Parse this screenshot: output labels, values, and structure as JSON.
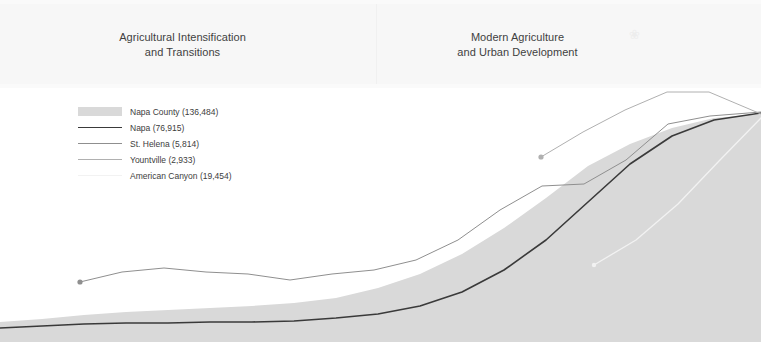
{
  "eras": {
    "dividers_x": [
      376
    ],
    "items": [
      {
        "label": "Agricultural Intensification\nand Transitions"
      },
      {
        "label": "Modern Agriculture\nand Urban Development"
      }
    ],
    "decorative_mark": "❀"
  },
  "legend": {
    "items": [
      {
        "name": "Napa County",
        "value": "136,484",
        "label": "Napa County (136,484)",
        "swatch": "area",
        "color": "#d9d9d9",
        "width": 0
      },
      {
        "name": "Napa",
        "value": "76,915",
        "label": "Napa (76,915)",
        "swatch": "line",
        "color": "#3a3a3a",
        "width": 1.6
      },
      {
        "name": "St. Helena",
        "value": "5,814",
        "label": "St. Helena (5,814)",
        "swatch": "line",
        "color": "#8f8f8f",
        "width": 1.0
      },
      {
        "name": "Yountville",
        "value": "2,933",
        "label": "Yountville (2,933)",
        "swatch": "line",
        "color": "#b0b0b0",
        "width": 1.0
      },
      {
        "name": "American Canyon",
        "value": "19,454",
        "label": "American Canyon (19,454)",
        "swatch": "line",
        "color": "#f2f2f2",
        "width": 1.2
      }
    ]
  },
  "chart_data": {
    "type": "area",
    "title": "",
    "xlabel": "",
    "ylabel": "",
    "grid": false,
    "legend_position": "top-left",
    "colors": {
      "napa_county_area": "#d9d9d9",
      "napa_line": "#3a3a3a",
      "st_helena_line": "#8f8f8f",
      "yountville_line": "#b0b0b0",
      "american_canyon_line": "#f2f2f2",
      "band_background": "#f7f7f7",
      "page_background": "#ffffff"
    },
    "series": [
      {
        "name": "Napa County",
        "render": "area",
        "final_value": "136,484",
        "points": [
          [
            0,
            234
          ],
          [
            42,
            231
          ],
          [
            84,
            227
          ],
          [
            126,
            224
          ],
          [
            168,
            222
          ],
          [
            210,
            220
          ],
          [
            252,
            218
          ],
          [
            294,
            215
          ],
          [
            336,
            210
          ],
          [
            378,
            200
          ],
          [
            420,
            186
          ],
          [
            462,
            166
          ],
          [
            504,
            140
          ],
          [
            546,
            110
          ],
          [
            588,
            78
          ],
          [
            630,
            56
          ],
          [
            672,
            40
          ],
          [
            714,
            30
          ],
          [
            761,
            26
          ]
        ]
      },
      {
        "name": "Napa",
        "render": "line",
        "final_value": "76,915",
        "points": [
          [
            0,
            240
          ],
          [
            42,
            238
          ],
          [
            84,
            236
          ],
          [
            126,
            235
          ],
          [
            168,
            235
          ],
          [
            210,
            234
          ],
          [
            252,
            234
          ],
          [
            294,
            233
          ],
          [
            336,
            230
          ],
          [
            378,
            226
          ],
          [
            420,
            218
          ],
          [
            462,
            204
          ],
          [
            504,
            182
          ],
          [
            546,
            152
          ],
          [
            588,
            114
          ],
          [
            630,
            76
          ],
          [
            672,
            48
          ],
          [
            714,
            32
          ],
          [
            761,
            25
          ]
        ]
      },
      {
        "name": "St. Helena",
        "render": "line",
        "final_value": "5,814",
        "start_marker": true,
        "points": [
          [
            80,
            194
          ],
          [
            122,
            184
          ],
          [
            164,
            180
          ],
          [
            206,
            184
          ],
          [
            248,
            186
          ],
          [
            290,
            192
          ],
          [
            332,
            186
          ],
          [
            374,
            182
          ],
          [
            416,
            172
          ],
          [
            458,
            152
          ],
          [
            500,
            122
          ],
          [
            542,
            98
          ],
          [
            584,
            96
          ],
          [
            626,
            72
          ],
          [
            668,
            36
          ],
          [
            710,
            28
          ],
          [
            761,
            24
          ]
        ]
      },
      {
        "name": "Yountville",
        "render": "line",
        "final_value": "2,933",
        "start_marker": true,
        "points": [
          [
            541,
            69
          ],
          [
            583,
            44
          ],
          [
            625,
            22
          ],
          [
            667,
            4
          ],
          [
            709,
            4
          ],
          [
            761,
            26
          ]
        ]
      },
      {
        "name": "American Canyon",
        "render": "line",
        "final_value": "19,454",
        "start_marker": true,
        "points": [
          [
            594,
            177
          ],
          [
            636,
            152
          ],
          [
            678,
            116
          ],
          [
            720,
            72
          ],
          [
            761,
            30
          ]
        ]
      }
    ]
  }
}
